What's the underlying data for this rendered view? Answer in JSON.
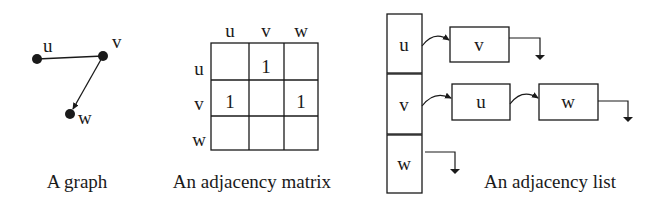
{
  "graph": {
    "caption": "A graph",
    "nodes": [
      {
        "id": "u",
        "label": "u",
        "x": 37,
        "y": 59
      },
      {
        "id": "v",
        "label": "v",
        "x": 103,
        "y": 56
      },
      {
        "id": "w",
        "label": "w",
        "x": 70,
        "y": 114
      }
    ],
    "edges": [
      {
        "from": "u",
        "to": "v",
        "directed": false
      },
      {
        "from": "v",
        "to": "w",
        "directed": true
      }
    ]
  },
  "matrix": {
    "caption": "An adjacency matrix",
    "col_headers": [
      "u",
      "v",
      "w"
    ],
    "row_headers": [
      "u",
      "v",
      "w"
    ],
    "cells": [
      [
        "",
        "1",
        ""
      ],
      [
        "1",
        "",
        "1"
      ],
      [
        "",
        "",
        ""
      ]
    ]
  },
  "adjacency_list": {
    "caption": "An adjacency list",
    "heads": [
      {
        "label": "u",
        "neighbors": [
          "v"
        ]
      },
      {
        "label": "v",
        "neighbors": [
          "u",
          "w"
        ]
      },
      {
        "label": "w",
        "neighbors": []
      }
    ]
  },
  "colors": {
    "ink": "#1a1a1a",
    "background": "#ffffff"
  }
}
